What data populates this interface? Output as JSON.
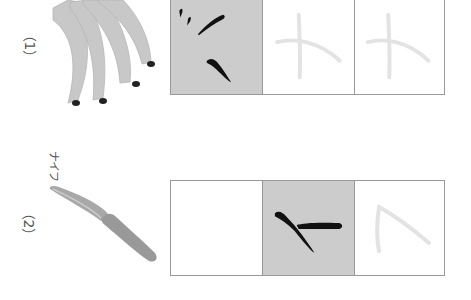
{
  "exercises": [
    {
      "number_label": "（1）",
      "reading": "",
      "picture": "banana-bunch",
      "character": "ナ",
      "cells": [
        {
          "state": "stroke-example",
          "shaded": true
        },
        {
          "state": "trace",
          "shaded": false
        },
        {
          "state": "trace",
          "shaded": false
        }
      ]
    },
    {
      "number_label": "（2）",
      "reading": "ナイフ",
      "picture": "knife",
      "character": "イ / フ",
      "cells": [
        {
          "state": "blank",
          "shaded": false
        },
        {
          "state": "stroke-example",
          "shaded": true
        },
        {
          "state": "trace",
          "shaded": false
        }
      ]
    }
  ],
  "colors": {
    "shade": "#cccccc",
    "ink": "#111111",
    "trace": "#e3e3e3",
    "border": "#999999",
    "illustration": "#bdbdbd"
  }
}
